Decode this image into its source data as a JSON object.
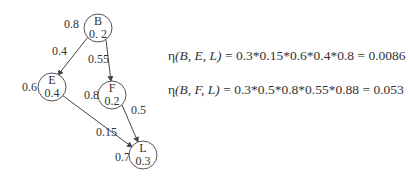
{
  "nodes": [
    {
      "id": "B",
      "label": "B",
      "value": "0. 2",
      "cx": 98,
      "cy": 28,
      "weight_label": "0.8"
    },
    {
      "id": "E",
      "label": "E",
      "value": "0.4",
      "cx": 51,
      "cy": 87,
      "weight_label": "0.6"
    },
    {
      "id": "F",
      "label": "F",
      "value": "0.2",
      "cx": 112,
      "cy": 95,
      "weight_label": "0.8"
    },
    {
      "id": "L",
      "label": "L",
      "value": "0.3",
      "cx": 143,
      "cy": 155,
      "weight_label": "0.7"
    }
  ],
  "edges": [
    {
      "from": "B",
      "to": "E",
      "label": "0.4"
    },
    {
      "from": "B",
      "to": "F",
      "label": "0.55"
    },
    {
      "from": "E",
      "to": "L",
      "label": "0.15"
    },
    {
      "from": "F",
      "to": "L",
      "label": "0.5"
    }
  ],
  "equations": {
    "eq1": {
      "lhs_fn": "η",
      "lhs_args": "(B, E, L)",
      "rhs": " = 0.3*0.15*0.6*0.4*0.8 = 0.0086"
    },
    "eq2": {
      "lhs_fn": "η",
      "lhs_args": "(B, F, L)",
      "rhs": " = 0.3*0.5*0.8*0.55*0.88 = 0.053"
    }
  }
}
